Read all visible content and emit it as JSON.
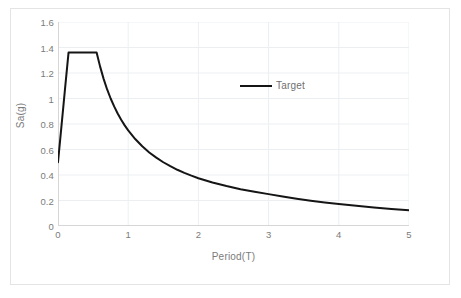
{
  "chart_data": {
    "type": "line",
    "title": "",
    "xlabel": "Period(T)",
    "ylabel": "Sa(g)",
    "xlim": [
      0,
      5
    ],
    "ylim": [
      0,
      1.6
    ],
    "x_ticks": [
      "0",
      "1",
      "2",
      "3",
      "4",
      "5"
    ],
    "x_tick_values": [
      0,
      1,
      2,
      3,
      4,
      5
    ],
    "y_ticks": [
      "0",
      "0.2",
      "0.4",
      "0.6",
      "0.8",
      "1",
      "1.2",
      "1.4",
      "1.6"
    ],
    "y_tick_values": [
      0,
      0.2,
      0.4,
      0.6,
      0.8,
      1,
      1.2,
      1.4,
      1.6
    ],
    "grid": true,
    "grid_color": "#eceff1",
    "legend_position": "inside-top-center",
    "series": [
      {
        "name": "Target",
        "color": "#151515",
        "line_width": 2,
        "x": [
          0.0,
          0.02,
          0.05,
          0.08,
          0.1,
          0.12,
          0.15,
          0.2,
          0.25,
          0.3,
          0.35,
          0.4,
          0.45,
          0.5,
          0.55,
          0.6,
          0.65,
          0.7,
          0.75,
          0.8,
          0.85,
          0.9,
          0.95,
          1.0,
          1.1,
          1.2,
          1.3,
          1.4,
          1.5,
          1.6,
          1.7,
          1.8,
          1.9,
          2.0,
          2.2,
          2.4,
          2.6,
          2.8,
          3.0,
          3.2,
          3.4,
          3.6,
          3.8,
          4.0,
          4.25,
          4.5,
          4.75,
          5.0
        ],
        "y": [
          0.5,
          0.615,
          0.787,
          0.96,
          1.075,
          1.19,
          1.36,
          1.36,
          1.36,
          1.36,
          1.36,
          1.36,
          1.36,
          1.36,
          1.36,
          1.25,
          1.154,
          1.071,
          1.0,
          0.938,
          0.882,
          0.833,
          0.789,
          0.75,
          0.682,
          0.625,
          0.577,
          0.536,
          0.5,
          0.469,
          0.441,
          0.417,
          0.395,
          0.375,
          0.341,
          0.313,
          0.288,
          0.268,
          0.25,
          0.232,
          0.214,
          0.198,
          0.184,
          0.172,
          0.158,
          0.146,
          0.134,
          0.123
        ]
      }
    ]
  },
  "legend": {
    "entries": [
      {
        "label": "Target",
        "color": "#151515"
      }
    ]
  },
  "axes": {
    "x_title": "Period(T)",
    "y_title": "Sa(g)"
  }
}
